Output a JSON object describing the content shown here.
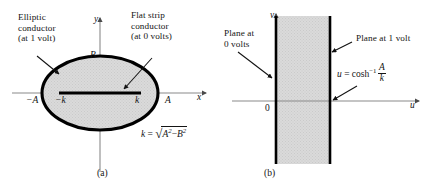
{
  "figure": {
    "panel_a": {
      "caption": "(a)",
      "annotations": {
        "elliptic_conductor": "Elliptic\nconductor\n(at 1 volt)",
        "flat_strip_conductor": "Flat strip\nconductor\n(at 0 volts)"
      },
      "axes": {
        "x_label": "x",
        "y_label": "y"
      },
      "markers": {
        "minus_A": "−A",
        "minus_k": "−k",
        "k": "k",
        "A": "A",
        "B": "B"
      },
      "formula": {
        "lhs": "k",
        "equals": "=",
        "radicand_first": "A",
        "radicand_exp1": "2",
        "minus": "−",
        "radicand_second": "B",
        "radicand_exp2": "2"
      }
    },
    "panel_b": {
      "caption": "(b)",
      "annotations": {
        "plane_0_volts": "Plane at\n0 volts",
        "plane_1_volt": "Plane at 1 volt"
      },
      "axes": {
        "x_label": "u",
        "y_label": "v"
      },
      "markers": {
        "origin": "0"
      },
      "formula": {
        "lhs": "u",
        "equals": "=",
        "func": "cosh",
        "exponent": "−1",
        "numerator": "A",
        "denominator": "k"
      }
    }
  },
  "colors": {
    "shaded_region": "#d8d8d8",
    "conductor_stroke": "#000000",
    "axis_stroke": "#8a8a8a",
    "text": "#141414"
  }
}
